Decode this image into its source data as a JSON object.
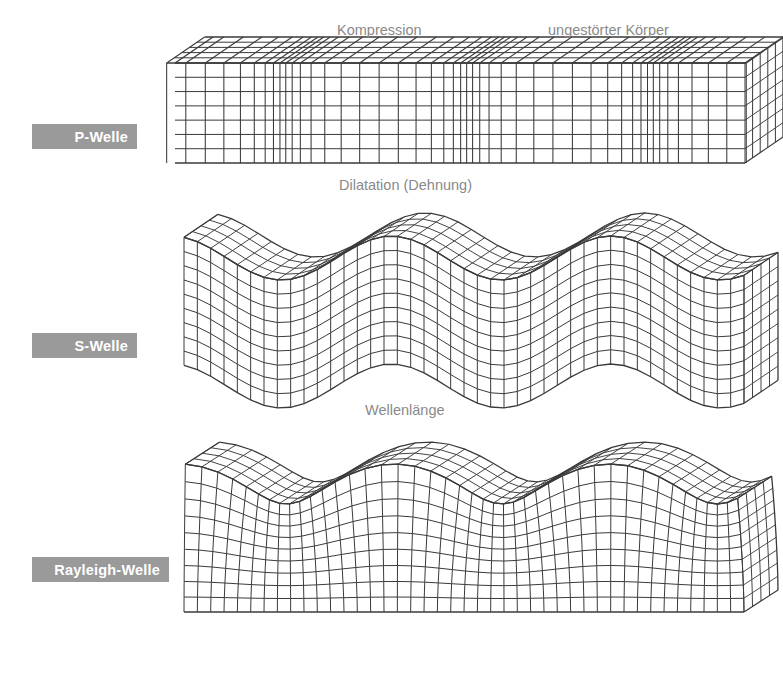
{
  "diagram": {
    "background_color": "#ffffff",
    "mesh_color": "#3a3a3a",
    "annotation_color": "#8a8a8a",
    "label_bg_color": "#9a9a9a",
    "label_text_color": "#ffffff",
    "arrow_color": "#9e9e9e"
  },
  "labels": {
    "p_wave": "P-Welle",
    "s_wave": "S-Welle",
    "rayleigh_wave": "Rayleigh-Welle"
  },
  "annotations": {
    "kompression": "Kompression",
    "ungestoerter_koerper": "ungestörter Körper",
    "dilatation": "Dilatation (Dehnung)",
    "wellenlaenge": "Wellenlänge"
  },
  "icons": {
    "propagation_arrow": "right-arrow-icon",
    "compression_arrow": "horizontal-double-arrow-icon",
    "shear_arrow": "vertical-double-arrow-icon",
    "rayleigh_ellipse": "elliptical-orbit-arrow-icon",
    "bracket": "dotted-bracket-icon"
  },
  "chart_data": {
    "type": "diagram",
    "panels": [
      {
        "name": "p-wave",
        "label": "P-Welle",
        "deformation": "longitudinal-compression-dilatation",
        "block": {
          "x": 175,
          "y": 63,
          "w": 570,
          "h": 100
        },
        "wavelength_px": 175,
        "annotations": [
          "Kompression",
          "ungestörter Körper",
          "Dilatation (Dehnung)"
        ],
        "propagation_arrow": {
          "x1": 178,
          "x2": 597,
          "y": 201
        }
      },
      {
        "name": "s-wave",
        "label": "S-Welle",
        "deformation": "transverse-vertical-shear",
        "block": {
          "x": 184,
          "y": 258,
          "w": 560,
          "h": 128
        },
        "amplitude_px": 22,
        "wavelength_px": 170,
        "annotations": [
          "Wellenlänge"
        ],
        "propagation_arrow": {
          "x1": 178,
          "x2": 597,
          "y": 431
        }
      },
      {
        "name": "rayleigh-wave",
        "label": "Rayleigh-Welle",
        "deformation": "retrograde-elliptical-surface",
        "block": {
          "x": 184,
          "y": 484,
          "w": 560,
          "h": 128
        },
        "amplitude_px": 20,
        "wavelength_px": 168,
        "annotations": [],
        "propagation_arrow": {
          "x1": 178,
          "x2": 597,
          "y": 634
        }
      }
    ]
  }
}
